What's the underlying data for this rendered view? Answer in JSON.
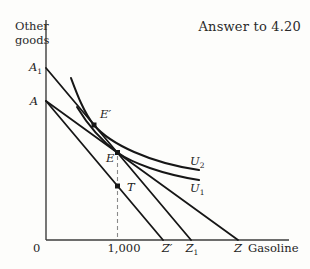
{
  "title": "Answer to 4.20",
  "axes": {
    "y_label_line1": "Other",
    "y_label_line2": "goods",
    "x_label": "Gasoline",
    "origin": "0",
    "x_tick": "1,000"
  },
  "labels": {
    "A1": {
      "base": "A",
      "sub": "1"
    },
    "A": {
      "base": "A"
    },
    "Eprime": {
      "base": "E′"
    },
    "E": {
      "base": "E"
    },
    "T": {
      "base": "T"
    },
    "U2": {
      "base": "U",
      "sub": "2"
    },
    "U1": {
      "base": "U",
      "sub": "1"
    },
    "Zprime": {
      "base": "Z′"
    },
    "Z1": {
      "base": "Z",
      "sub": "1"
    },
    "Z": {
      "base": "Z"
    }
  },
  "colors": {
    "line": "#161616",
    "axis": "#3d3d3d",
    "dash": "#8a8a8a",
    "background": "#fdfdfb"
  },
  "geometry": {
    "width": 310,
    "height": 269,
    "axis_v": {
      "x": 46,
      "y1": 20,
      "y2": 240
    },
    "axis_h": {
      "y": 240,
      "x1": 46,
      "x2": 289
    },
    "budget_lines": [
      {
        "name": "budget-line-A1-Z1",
        "x1": 46,
        "y1": 68,
        "x2": 191,
        "y2": 240
      },
      {
        "name": "budget-line-A-Z",
        "x1": 46,
        "y1": 101,
        "x2": 238,
        "y2": 240
      },
      {
        "name": "budget-line-A-Zprime",
        "x1": 46,
        "y1": 101,
        "x2": 163,
        "y2": 240
      }
    ],
    "dashed_line": {
      "name": "ration-guide-line",
      "x1": 117.5,
      "y1": 156,
      "x2": 117.5,
      "y2": 240
    },
    "curves": [
      {
        "name": "indifference-curve-U2",
        "path": "M71,78 C77,94 84,113 94,125 C110,144 150,163 199,170"
      },
      {
        "name": "indifference-curve-U1",
        "path": "M77,107 C86,122 99,139 117.5,152.5 C132,163 162,174 199,180"
      }
    ],
    "points": [
      {
        "name": "point-Eprime",
        "x": 94,
        "y": 125
      },
      {
        "name": "point-E",
        "x": 117.5,
        "y": 152.5
      },
      {
        "name": "point-T",
        "x": 117.5,
        "y": 186
      }
    ]
  }
}
